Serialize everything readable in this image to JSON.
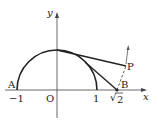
{
  "diagram": {
    "axes": {
      "x_label": "x",
      "y_label": "y",
      "origin_label": "O"
    },
    "ticks": {
      "minus_one": "−1",
      "one": "1",
      "sqrt2_radical": "√",
      "sqrt2_value": "2"
    },
    "points": {
      "A": "A",
      "B": "B",
      "P": "P"
    },
    "colors": {
      "stroke": "#222222",
      "background": "#ffffff"
    }
  }
}
